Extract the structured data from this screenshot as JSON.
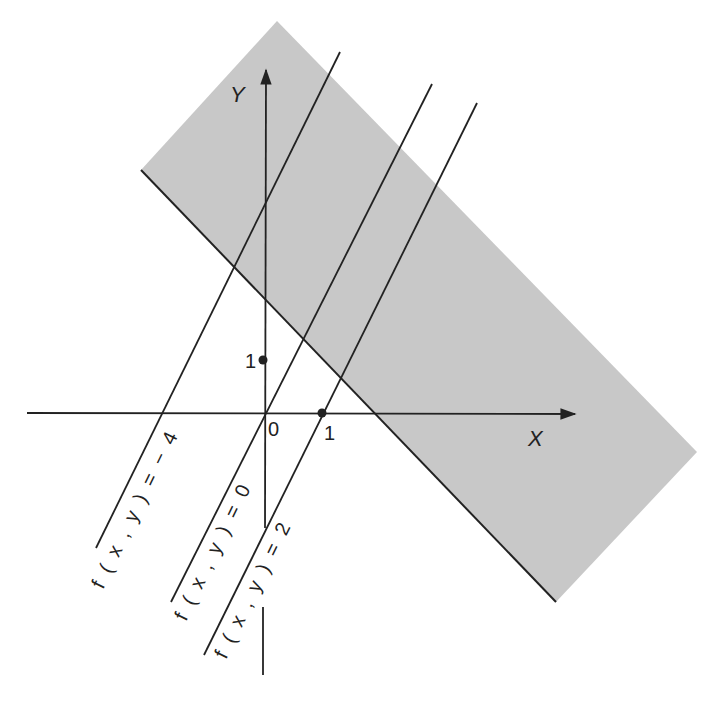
{
  "diagram": {
    "type": "level-set-lines-with-half-plane",
    "colors": {
      "background": "#ffffff",
      "shaded_region": "#c8c8c8",
      "ink": "#222222"
    },
    "axes": {
      "x_label": "X",
      "y_label": "Y",
      "origin_label": "0",
      "x_tick_label": "1",
      "y_tick_label": "1"
    },
    "level_lines": [
      {
        "label": "f ( x , y ) = − 4",
        "value": -4
      },
      {
        "label": "f ( x , y ) = 0",
        "value": 0
      },
      {
        "label": "f ( x , y ) = 2",
        "value": 2
      }
    ],
    "shaded_region": {
      "description": "half-plane band (shaded gray) bounded on lower-left by a dark line"
    }
  }
}
